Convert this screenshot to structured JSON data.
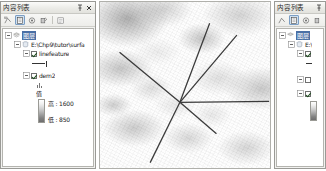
{
  "window": {
    "app": "ArcMap",
    "background_color": "#ffffff"
  },
  "toc_panel": {
    "title": "内容列表",
    "pin_icon": "pin-icon",
    "close_icon": "close-icon",
    "toolbar": {
      "items": [
        {
          "name": "list-by-drawing-order-icon",
          "label": "按绘制顺序列出",
          "pressed": false
        },
        {
          "name": "list-by-source-icon",
          "label": "按源列出",
          "pressed": true
        },
        {
          "name": "list-by-visibility-icon",
          "label": "按可见性列出",
          "pressed": false
        },
        {
          "name": "list-by-selection-icon",
          "label": "按选择列出",
          "pressed": false
        },
        {
          "name": "options-icon",
          "label": "选项",
          "pressed": false
        }
      ]
    },
    "tree": {
      "root": {
        "label": "图层",
        "selected": true,
        "expanded": true,
        "icon": "layers-icon"
      },
      "datasource": {
        "label": "E:\\Chp9\\tutor\\surfa",
        "expanded": true,
        "icon": "folder-database-icon"
      },
      "layers": [
        {
          "label": "linefeature",
          "checked": true,
          "expanded": true,
          "symbol": "line-symbol"
        },
        {
          "label": "dem2",
          "checked": true,
          "expanded": true,
          "legend": {
            "header": "值",
            "high_label": "高 : 1600",
            "low_label": "低 : 850",
            "high_value": 1600,
            "low_value": 850,
            "ramp_top_color": "#ffffff",
            "ramp_bottom_color": "#6e6e6e"
          }
        }
      ]
    }
  },
  "toc_panel_secondary": {
    "title": "内容列表",
    "pin_icon": "pin-icon",
    "close_icon": "close-icon",
    "tree": {
      "root_label": "图层",
      "datasource_label": "E:\\",
      "rows": [
        "linefeature",
        "dem2"
      ]
    }
  },
  "map": {
    "name": "dem2-hillshade-view",
    "raster_layer": "dem2",
    "line_layer": "linefeature",
    "observer_point": {
      "x": 0.47,
      "y": 0.59
    },
    "sight_lines": [
      {
        "x1": 0.47,
        "y1": 0.59,
        "x2": 0.115,
        "y2": 0.295
      },
      {
        "x1": 0.47,
        "y1": 0.59,
        "x2": 0.645,
        "y2": 0.125
      },
      {
        "x1": 0.47,
        "y1": 0.59,
        "x2": 0.805,
        "y2": 0.195
      },
      {
        "x1": 0.47,
        "y1": 0.59,
        "x2": 0.995,
        "y2": 0.585
      },
      {
        "x1": 0.47,
        "y1": 0.59,
        "x2": 0.685,
        "y2": 0.775
      },
      {
        "x1": 0.47,
        "y1": 0.59,
        "x2": 0.295,
        "y2": 0.945
      }
    ],
    "line_color": "#3a3a3a"
  }
}
